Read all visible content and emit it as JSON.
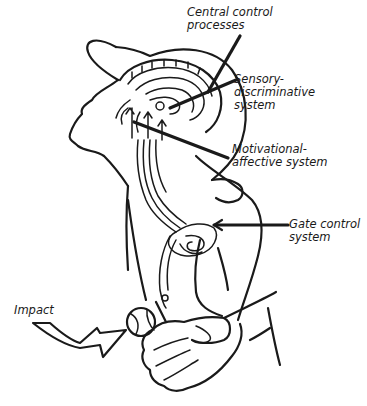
{
  "diagram": {
    "labels": {
      "central_control": {
        "line1": "Central control",
        "line2": "processes"
      },
      "sensory": {
        "line1": "Sensory-",
        "line2": "discriminative",
        "line3": "system"
      },
      "motivational": {
        "line1": "Motivational-",
        "line2": "affective system"
      },
      "gate": {
        "line1": "Gate control",
        "line2": "system"
      },
      "impact": {
        "line1": "Impact"
      }
    },
    "colors": {
      "ink": "#1a1a1a",
      "background": "#ffffff"
    }
  }
}
